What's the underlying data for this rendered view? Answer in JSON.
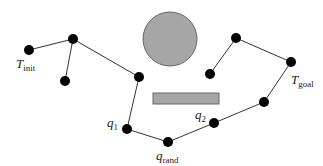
{
  "diagram": {
    "type": "rrt-bidirectional-tree",
    "colors": {
      "node": "#000000",
      "edge": "#333333",
      "obstacle": "#a6a6a6",
      "obstacle_stroke": "#666666"
    },
    "obstacles": [
      {
        "shape": "circle",
        "cx": 170,
        "cy": 39,
        "r": 27
      },
      {
        "shape": "rect",
        "x": 153,
        "y": 93,
        "w": 66,
        "h": 11
      }
    ],
    "nodes": [
      {
        "id": "t_init",
        "x": 29,
        "y": 50
      },
      {
        "id": "a",
        "x": 73,
        "y": 39
      },
      {
        "id": "b",
        "x": 65,
        "y": 81
      },
      {
        "id": "c",
        "x": 139,
        "y": 77
      },
      {
        "id": "q1",
        "x": 127,
        "y": 129
      },
      {
        "id": "q_rand",
        "x": 168,
        "y": 142
      },
      {
        "id": "q2",
        "x": 214,
        "y": 123
      },
      {
        "id": "d",
        "x": 264,
        "y": 102
      },
      {
        "id": "t_goal",
        "x": 291,
        "y": 62
      },
      {
        "id": "e",
        "x": 236,
        "y": 38
      },
      {
        "id": "f",
        "x": 210,
        "y": 74
      }
    ],
    "edges": [
      [
        "t_init",
        "a"
      ],
      [
        "a",
        "b"
      ],
      [
        "a",
        "c"
      ],
      [
        "c",
        "q1"
      ],
      [
        "q1",
        "q_rand"
      ],
      [
        "q_rand",
        "q2"
      ],
      [
        "q2",
        "d"
      ],
      [
        "d",
        "t_goal"
      ],
      [
        "t_goal",
        "e"
      ],
      [
        "e",
        "f"
      ]
    ],
    "labels": {
      "t_init": {
        "main": "T",
        "sub": "init"
      },
      "t_goal": {
        "main": "T",
        "sub": "goal"
      },
      "q1": {
        "main": "q",
        "sub": "1"
      },
      "q2": {
        "main": "q",
        "sub": "2"
      },
      "q_rand": {
        "main": "q",
        "sub": "rand"
      }
    }
  }
}
